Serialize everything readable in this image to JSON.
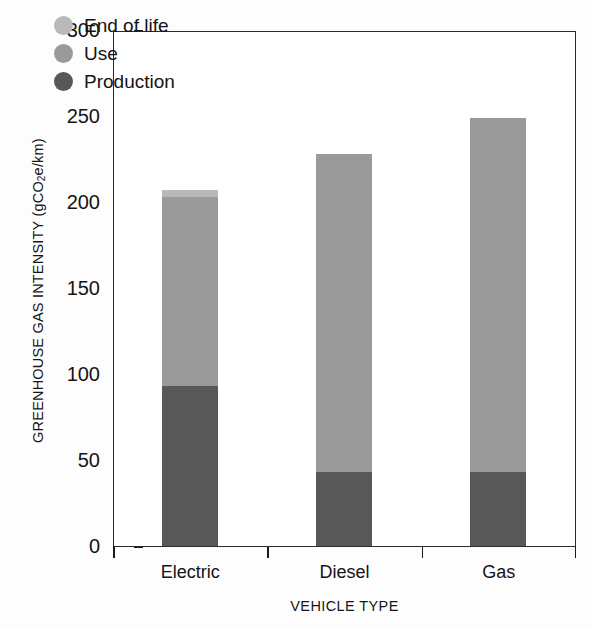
{
  "chart_data": {
    "type": "bar",
    "subtype": "stacked-vertical",
    "title": "",
    "xlabel": "VEHICLE TYPE",
    "ylabel": "GREENHOUSE GAS INTENSITY (gCO2e/km)",
    "ylabel_parts": {
      "before": "GREENHOUSE GAS INTENSITY (gCO",
      "sub": "2",
      "after": "e/km)"
    },
    "categories": [
      "Electric",
      "Diesel",
      "Gas"
    ],
    "series": [
      {
        "name": "Production",
        "color": "#585858",
        "values": [
          93,
          43,
          43
        ]
      },
      {
        "name": "Use",
        "color": "#9a9a9a",
        "values": [
          110,
          185,
          206
        ]
      },
      {
        "name": "End of life",
        "color": "#b9b9b9",
        "values": [
          4,
          0,
          0
        ]
      }
    ],
    "totals": [
      207,
      228,
      249
    ],
    "ylim": [
      0,
      300
    ],
    "yticks": [
      0,
      50,
      100,
      150,
      200,
      250,
      300
    ],
    "ytick_labels": [
      "0",
      "50",
      "100",
      "150",
      "200",
      "250",
      "300"
    ],
    "grid": false,
    "legend_position": "top-left-inside",
    "legend": [
      {
        "label": "End of life",
        "color": "#b9b9b9",
        "marker": "circle"
      },
      {
        "label": "Use",
        "color": "#9a9a9a",
        "marker": "circle"
      },
      {
        "label": "Production",
        "color": "#585858",
        "marker": "circle"
      }
    ]
  }
}
